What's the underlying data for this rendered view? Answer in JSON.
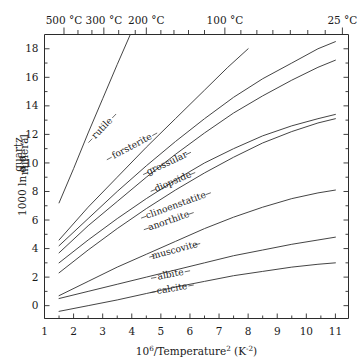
{
  "chart_data": {
    "type": "line",
    "title": "",
    "xlabel": "10⁶/Temperature²  (K⁻²)",
    "ylabel": "1000 ln α",
    "ylabel_sub_top": "quartz",
    "ylabel_sub_bottom": "mineral",
    "xlim": [
      1,
      11.45
    ],
    "ylim": [
      -0.9,
      19.0
    ],
    "xticks": [
      1,
      2,
      3,
      4,
      5,
      6,
      7,
      8,
      9,
      10,
      11
    ],
    "xticklabels": [
      "1",
      "2",
      "3",
      "4",
      "5",
      "6",
      "7",
      "8",
      "9",
      "10",
      "11"
    ],
    "yticks": [
      0,
      2,
      4,
      6,
      8,
      10,
      12,
      14,
      16,
      18
    ],
    "yticklabels": [
      "0",
      "2",
      "4",
      "6",
      "8",
      "10",
      "12",
      "14",
      "16",
      "18"
    ],
    "grid": false,
    "legend": "inline-curve-labels",
    "top_axis_label": "Temperature",
    "top_axis_ticks": [
      {
        "x": 1.67,
        "label": "500 °C",
        "major": true
      },
      {
        "x": 2.15,
        "label": "",
        "major": false
      },
      {
        "x": 2.63,
        "label": "",
        "major": false
      },
      {
        "x": 3.04,
        "label": "300 °C",
        "major": true
      },
      {
        "x": 3.55,
        "label": "",
        "major": false
      },
      {
        "x": 4.12,
        "label": "",
        "major": false
      },
      {
        "x": 4.5,
        "label": "200 °C",
        "major": true
      },
      {
        "x": 5.0,
        "label": "",
        "major": false
      },
      {
        "x": 5.45,
        "label": "",
        "major": false
      },
      {
        "x": 5.95,
        "label": "",
        "major": false
      },
      {
        "x": 6.5,
        "label": "",
        "major": false
      },
      {
        "x": 7.2,
        "label": "100 °C",
        "major": true
      },
      {
        "x": 7.75,
        "label": "",
        "major": false
      },
      {
        "x": 8.3,
        "label": "",
        "major": false
      },
      {
        "x": 8.85,
        "label": "",
        "major": false
      },
      {
        "x": 9.45,
        "label": "",
        "major": false
      },
      {
        "x": 10.05,
        "label": "",
        "major": false
      },
      {
        "x": 10.65,
        "label": "",
        "major": false
      },
      {
        "x": 11.24,
        "label": "25 °C",
        "major": true
      }
    ],
    "series": [
      {
        "name": "rutile",
        "label": "rutile",
        "label_x": 3.05,
        "label_y": 12.3,
        "label_rotation": -46,
        "points": [
          [
            1.5,
            7.2
          ],
          [
            2.0,
            9.6
          ],
          [
            2.5,
            12.1
          ],
          [
            3.0,
            14.5
          ],
          [
            3.5,
            16.9
          ],
          [
            3.95,
            19.0
          ]
        ]
      },
      {
        "name": "forsterite",
        "label": "forsterite",
        "label_x": 4.05,
        "label_y": 11.0,
        "label_rotation": -28,
        "points": [
          [
            1.5,
            4.6
          ],
          [
            2.5,
            6.9
          ],
          [
            3.5,
            9.0
          ],
          [
            4.5,
            11.1
          ],
          [
            5.5,
            13.1
          ],
          [
            6.5,
            15.1
          ],
          [
            7.3,
            16.7
          ],
          [
            8.0,
            18.0
          ]
        ]
      },
      {
        "name": "grossular",
        "label": "grossular",
        "label_x": 5.25,
        "label_y": 9.8,
        "label_rotation": -25,
        "points": [
          [
            1.5,
            4.2
          ],
          [
            2.5,
            6.1
          ],
          [
            3.5,
            8.0
          ],
          [
            4.5,
            9.8
          ],
          [
            5.5,
            11.5
          ],
          [
            6.5,
            13.1
          ],
          [
            7.5,
            14.6
          ],
          [
            8.5,
            15.9
          ],
          [
            9.5,
            17.0
          ],
          [
            10.4,
            18.0
          ],
          [
            11.0,
            18.5
          ]
        ]
      },
      {
        "name": "diopside",
        "label": "diopside",
        "label_x": 5.45,
        "label_y": 8.5,
        "label_rotation": -23,
        "points": [
          [
            1.5,
            3.7
          ],
          [
            2.5,
            5.6
          ],
          [
            3.5,
            7.3
          ],
          [
            4.5,
            9.0
          ],
          [
            5.5,
            10.6
          ],
          [
            6.5,
            12.1
          ],
          [
            7.5,
            13.5
          ],
          [
            8.5,
            14.7
          ],
          [
            9.5,
            15.8
          ],
          [
            10.4,
            16.7
          ],
          [
            11.0,
            17.2
          ]
        ]
      },
      {
        "name": "clinoenstatite",
        "label": "clinoenstatite",
        "label_x": 5.55,
        "label_y": 6.85,
        "label_rotation": -20,
        "points": [
          [
            1.5,
            3.0
          ],
          [
            2.5,
            4.6
          ],
          [
            3.5,
            6.1
          ],
          [
            4.5,
            7.5
          ],
          [
            5.5,
            8.8
          ],
          [
            6.5,
            10.0
          ],
          [
            7.5,
            11.0
          ],
          [
            8.5,
            11.9
          ],
          [
            9.5,
            12.6
          ],
          [
            10.4,
            13.1
          ],
          [
            11.0,
            13.4
          ]
        ]
      },
      {
        "name": "anorthite",
        "label": "anorthite",
        "label_x": 5.3,
        "label_y": 5.75,
        "label_rotation": -19,
        "points": [
          [
            1.5,
            2.3
          ],
          [
            2.5,
            3.9
          ],
          [
            3.5,
            5.4
          ],
          [
            4.5,
            6.8
          ],
          [
            5.5,
            8.1
          ],
          [
            6.5,
            9.3
          ],
          [
            7.5,
            10.4
          ],
          [
            8.5,
            11.4
          ],
          [
            9.5,
            12.2
          ],
          [
            10.4,
            12.8
          ],
          [
            11.0,
            13.1
          ]
        ]
      },
      {
        "name": "muscovite",
        "label": "muscovite",
        "label_x": 5.5,
        "label_y": 3.7,
        "label_rotation": -15,
        "points": [
          [
            1.5,
            0.7
          ],
          [
            2.5,
            1.7
          ],
          [
            3.5,
            2.7
          ],
          [
            4.5,
            3.6
          ],
          [
            5.5,
            4.5
          ],
          [
            6.5,
            5.4
          ],
          [
            7.5,
            6.2
          ],
          [
            8.5,
            6.9
          ],
          [
            9.5,
            7.5
          ],
          [
            10.4,
            7.9
          ],
          [
            11.0,
            8.1
          ]
        ]
      },
      {
        "name": "albite",
        "label": "albite",
        "label_x": 5.35,
        "label_y": 2.0,
        "label_rotation": -11,
        "points": [
          [
            1.5,
            0.5
          ],
          [
            2.5,
            1.0
          ],
          [
            3.5,
            1.5
          ],
          [
            4.5,
            2.0
          ],
          [
            5.5,
            2.5
          ],
          [
            6.5,
            3.0
          ],
          [
            7.5,
            3.5
          ],
          [
            8.5,
            3.9
          ],
          [
            9.5,
            4.3
          ],
          [
            10.4,
            4.6
          ],
          [
            11.0,
            4.8
          ]
        ]
      },
      {
        "name": "calcite",
        "label": "calcite",
        "label_x": 5.4,
        "label_y": 1.0,
        "label_rotation": -10,
        "points": [
          [
            1.5,
            -0.4
          ],
          [
            2.5,
            0.0
          ],
          [
            3.5,
            0.4
          ],
          [
            4.5,
            0.85
          ],
          [
            5.5,
            1.3
          ],
          [
            6.5,
            1.7
          ],
          [
            7.5,
            2.1
          ],
          [
            8.5,
            2.4
          ],
          [
            9.5,
            2.7
          ],
          [
            10.4,
            2.9
          ],
          [
            11.0,
            3.0
          ]
        ]
      }
    ]
  }
}
